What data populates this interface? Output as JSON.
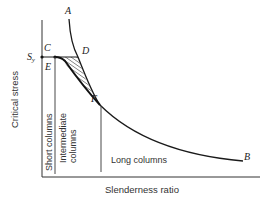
{
  "diagram": {
    "axes": {
      "y_label": "Critical stress",
      "x_label": "Slenderness ratio"
    },
    "points": {
      "A": "A",
      "B": "B",
      "C": "C",
      "D": "D",
      "E": "E",
      "F": "F",
      "Sy_main": "S",
      "Sy_sub": "y"
    },
    "regions": {
      "short": "Short columns",
      "intermediate_line1": "Intermediate",
      "intermediate_line2": "columns",
      "long": "Long columns"
    },
    "colors": {
      "line": "#1a1a1a",
      "axis": "#333333",
      "text": "#333333"
    }
  }
}
